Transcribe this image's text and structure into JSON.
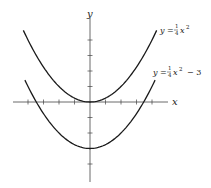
{
  "chart_data": {
    "type": "line",
    "title": "",
    "xlabel": "x",
    "ylabel": "y",
    "xlim": [
      -5.5,
      5
    ],
    "ylim": [
      -4.5,
      5.5
    ],
    "grid": false,
    "x_ticks": [
      -4,
      -3,
      -2,
      -1,
      1,
      2,
      3,
      4
    ],
    "y_ticks": [
      -4,
      -3,
      -2,
      -1,
      1,
      2,
      3,
      4
    ],
    "series": [
      {
        "name": "y = 1/4 x^2",
        "equation": "y = (1/4)x^2",
        "x": [
          -4.3,
          -4,
          -3,
          -2,
          -1,
          0,
          1,
          2,
          3,
          4,
          4.3
        ],
        "values": [
          4.62,
          4,
          2.25,
          1,
          0.25,
          0,
          0.25,
          1,
          2.25,
          4,
          4.62
        ]
      },
      {
        "name": "y = 1/4 x^2 - 3",
        "equation": "y = (1/4)x^2 - 3",
        "x": [
          -4.2,
          -4,
          -3,
          -2,
          -1,
          0,
          1,
          2,
          3,
          4,
          4.2
        ],
        "values": [
          1.41,
          1,
          -0.75,
          -2,
          -2.75,
          -3,
          -2.75,
          -2,
          -0.75,
          1,
          1.41
        ]
      }
    ],
    "annotations": [
      {
        "text": "y = 1/4 x^2",
        "attached_to": "upper curve right end"
      },
      {
        "text": "y = 1/4 x^2 - 3",
        "attached_to": "lower curve right end"
      }
    ]
  },
  "labels": {
    "x_axis": "x",
    "y_axis": "y",
    "curve1": {
      "lhs": "y =",
      "num": "1",
      "den": "4",
      "var": "x",
      "exp": "2",
      "tail": ""
    },
    "curve2": {
      "lhs": "y =",
      "num": "1",
      "den": "4",
      "var": "x",
      "exp": "2",
      "tail": "− 3"
    }
  }
}
